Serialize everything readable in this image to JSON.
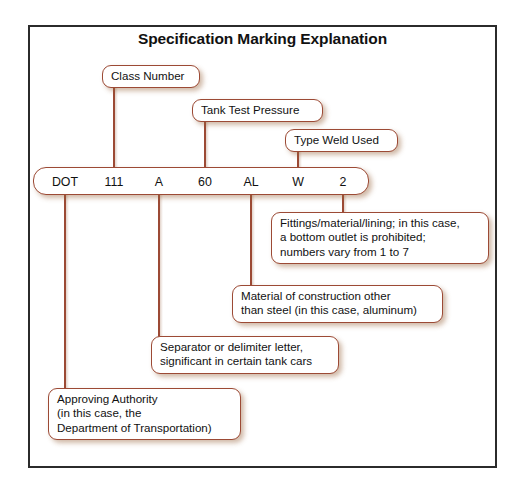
{
  "figure": {
    "title": "Specification Marking Explanation",
    "frame_color": "#2b2b2b",
    "accent_color": "#9c4a35",
    "background": "#ffffff"
  },
  "marking": {
    "segments": [
      {
        "key": "approving_authority",
        "value": "DOT",
        "center_x": 64
      },
      {
        "key": "class_number",
        "value": "111",
        "center_x": 113
      },
      {
        "key": "separator",
        "value": "A",
        "center_x": 158
      },
      {
        "key": "tank_test_pressure",
        "value": "60",
        "center_x": 204
      },
      {
        "key": "material",
        "value": "AL",
        "center_x": 250
      },
      {
        "key": "weld_type",
        "value": "W",
        "center_x": 297
      },
      {
        "key": "fittings",
        "value": "2",
        "center_x": 342
      }
    ]
  },
  "callouts_above": [
    {
      "key": "class-number",
      "text": "Class Number",
      "left": 102,
      "top": 65,
      "width": 98,
      "line_x": 113,
      "line_top": 85,
      "line_bottom": 167
    },
    {
      "key": "tank-test-pressure",
      "text": "Tank Test Pressure",
      "left": 192,
      "top": 99,
      "width": 131,
      "line_x": 204,
      "line_top": 119,
      "line_bottom": 167
    },
    {
      "key": "type-weld-used",
      "text": "Type Weld Used",
      "left": 285,
      "top": 129,
      "width": 113,
      "line_x": 297,
      "line_top": 149,
      "line_bottom": 167
    }
  ],
  "callouts_below": [
    {
      "key": "fittings",
      "text": "Fittings/material/lining; in this case,\na bottom outlet is prohibited;\nnumbers vary from 1 to 7",
      "left": 271,
      "top": 212,
      "width": 218,
      "line_x": 342,
      "line_top": 195,
      "line_bottom": 214
    },
    {
      "key": "material-of-construction",
      "text": "Material of construction other\nthan steel (in this case, aluminum)",
      "left": 232,
      "top": 285,
      "width": 211,
      "line_x": 250,
      "line_top": 195,
      "line_bottom": 287
    },
    {
      "key": "separator-delimiter",
      "text": "Separator or delimiter letter,\nsignificant in certain tank cars",
      "left": 151,
      "top": 336,
      "width": 188,
      "line_x": 158,
      "line_top": 195,
      "line_bottom": 338
    },
    {
      "key": "approving-authority",
      "text": "Approving Authority\n(in this case, the\nDepartment of Transportation)",
      "left": 48,
      "top": 388,
      "width": 193,
      "line_x": 64,
      "line_top": 195,
      "line_bottom": 390
    }
  ]
}
